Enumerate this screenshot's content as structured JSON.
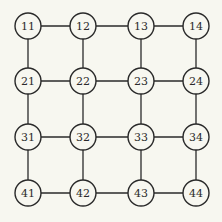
{
  "diagram": {
    "type": "grid-graph",
    "rows": 4,
    "cols": 4,
    "colors": {
      "background": "#f7f7f0",
      "stroke": "#2a2a2a",
      "node_fill": "#f7f7f0",
      "text": "#2a2a2a"
    },
    "col_x": [
      28,
      83,
      141,
      196
    ],
    "row_y": [
      26,
      81,
      137,
      193
    ],
    "node_radius": 13,
    "nodes": [
      {
        "id": "11",
        "label": "11",
        "row": 0,
        "col": 0
      },
      {
        "id": "12",
        "label": "12",
        "row": 0,
        "col": 1
      },
      {
        "id": "13",
        "label": "13",
        "row": 0,
        "col": 2
      },
      {
        "id": "14",
        "label": "14",
        "row": 0,
        "col": 3
      },
      {
        "id": "21",
        "label": "21",
        "row": 1,
        "col": 0
      },
      {
        "id": "22",
        "label": "22",
        "row": 1,
        "col": 1
      },
      {
        "id": "23",
        "label": "23",
        "row": 1,
        "col": 2
      },
      {
        "id": "24",
        "label": "24",
        "row": 1,
        "col": 3
      },
      {
        "id": "31",
        "label": "31",
        "row": 2,
        "col": 0
      },
      {
        "id": "32",
        "label": "32",
        "row": 2,
        "col": 1
      },
      {
        "id": "33",
        "label": "33",
        "row": 2,
        "col": 2
      },
      {
        "id": "34",
        "label": "34",
        "row": 2,
        "col": 3
      },
      {
        "id": "41",
        "label": "41",
        "row": 3,
        "col": 0
      },
      {
        "id": "42",
        "label": "42",
        "row": 3,
        "col": 1
      },
      {
        "id": "43",
        "label": "43",
        "row": 3,
        "col": 2
      },
      {
        "id": "44",
        "label": "44",
        "row": 3,
        "col": 3
      }
    ],
    "edges": [
      [
        "11",
        "12"
      ],
      [
        "12",
        "13"
      ],
      [
        "13",
        "14"
      ],
      [
        "21",
        "22"
      ],
      [
        "22",
        "23"
      ],
      [
        "23",
        "24"
      ],
      [
        "31",
        "32"
      ],
      [
        "32",
        "33"
      ],
      [
        "33",
        "34"
      ],
      [
        "41",
        "42"
      ],
      [
        "42",
        "43"
      ],
      [
        "43",
        "44"
      ],
      [
        "11",
        "21"
      ],
      [
        "21",
        "31"
      ],
      [
        "31",
        "41"
      ],
      [
        "12",
        "22"
      ],
      [
        "22",
        "32"
      ],
      [
        "32",
        "42"
      ],
      [
        "13",
        "23"
      ],
      [
        "23",
        "33"
      ],
      [
        "33",
        "43"
      ],
      [
        "14",
        "24"
      ],
      [
        "24",
        "34"
      ],
      [
        "34",
        "44"
      ]
    ]
  }
}
